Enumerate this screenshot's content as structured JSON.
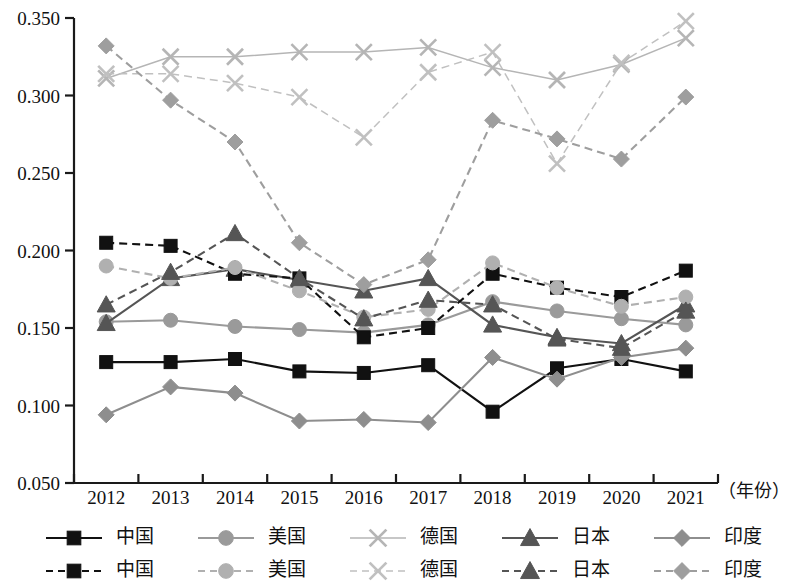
{
  "chart_data": {
    "type": "line",
    "title": "",
    "xlabel": "（年份）",
    "ylabel": "",
    "categories": [
      "2012",
      "2013",
      "2014",
      "2015",
      "2016",
      "2017",
      "2018",
      "2019",
      "2020",
      "2021"
    ],
    "x": [
      2012,
      2013,
      2014,
      2015,
      2016,
      2017,
      2018,
      2019,
      2020,
      2021
    ],
    "ylim": [
      0.05,
      0.35
    ],
    "ytick_labels": [
      "0.350",
      "0.300",
      "0.250",
      "0.200",
      "0.150",
      "0.100",
      "0.050"
    ],
    "yticks": [
      0.35,
      0.3,
      0.25,
      0.2,
      0.15,
      0.1,
      0.05
    ],
    "grid": false,
    "legend_position": "bottom",
    "series": [
      {
        "name": "中国",
        "legend_label": "中国",
        "style": "solid",
        "marker": "square",
        "color": "#111111",
        "values": [
          0.128,
          0.128,
          0.13,
          0.122,
          0.121,
          0.126,
          0.096,
          0.124,
          0.13,
          0.122
        ]
      },
      {
        "name": "美国",
        "legend_label": "美国",
        "style": "solid",
        "marker": "circle",
        "color": "#9a9a9a",
        "values": [
          0.154,
          0.155,
          0.151,
          0.149,
          0.147,
          0.152,
          0.167,
          0.161,
          0.156,
          0.152
        ]
      },
      {
        "name": "德国",
        "legend_label": "德国",
        "style": "solid",
        "marker": "cross",
        "color": "#b5b5b5",
        "values": [
          0.311,
          0.325,
          0.325,
          0.328,
          0.328,
          0.331,
          0.318,
          0.31,
          0.32,
          0.337
        ]
      },
      {
        "name": "日本",
        "legend_label": "日本",
        "style": "solid",
        "marker": "triangle",
        "color": "#555555",
        "values": [
          0.153,
          0.182,
          0.188,
          0.181,
          0.174,
          0.182,
          0.152,
          0.144,
          0.14,
          0.165
        ]
      },
      {
        "name": "印度",
        "legend_label": "印度",
        "style": "solid",
        "marker": "diamond",
        "color": "#8e8e8e",
        "values": [
          0.094,
          0.112,
          0.108,
          0.09,
          0.091,
          0.089,
          0.131,
          0.117,
          0.131,
          0.137
        ]
      },
      {
        "name": "中国",
        "legend_label": "中国",
        "style": "dashed",
        "marker": "square",
        "color": "#111111",
        "values": [
          0.205,
          0.203,
          0.185,
          0.182,
          0.144,
          0.15,
          0.185,
          0.176,
          0.17,
          0.187
        ]
      },
      {
        "name": "美国",
        "legend_label": "美国",
        "style": "dashed",
        "marker": "circle",
        "color": "#b0b0b0",
        "values": [
          0.19,
          0.182,
          0.189,
          0.174,
          0.157,
          0.162,
          0.192,
          0.176,
          0.164,
          0.17
        ]
      },
      {
        "name": "德国",
        "legend_label": "德国",
        "style": "dashed",
        "marker": "cross",
        "color": "#c0c0c0",
        "values": [
          0.314,
          0.314,
          0.308,
          0.299,
          0.273,
          0.315,
          0.328,
          0.256,
          0.321,
          0.348
        ]
      },
      {
        "name": "日本",
        "legend_label": "日本",
        "style": "dashed",
        "marker": "triangle",
        "color": "#555555",
        "values": [
          0.165,
          0.186,
          0.211,
          0.182,
          0.156,
          0.168,
          0.165,
          0.143,
          0.137,
          0.161
        ]
      },
      {
        "name": "印度",
        "legend_label": "印度",
        "style": "dashed",
        "marker": "diamond",
        "color": "#9e9e9e",
        "values": [
          0.332,
          0.297,
          0.27,
          0.205,
          0.178,
          0.194,
          0.284,
          0.272,
          0.259,
          0.299
        ]
      }
    ]
  },
  "legend": {
    "rows": [
      {
        "style": "solid",
        "items": [
          {
            "label": "中国",
            "marker": "square",
            "color": "#111111"
          },
          {
            "label": "美国",
            "marker": "circle",
            "color": "#9a9a9a"
          },
          {
            "label": "德国",
            "marker": "cross",
            "color": "#b5b5b5"
          },
          {
            "label": "日本",
            "marker": "triangle",
            "color": "#555555"
          },
          {
            "label": "印度",
            "marker": "diamond",
            "color": "#8e8e8e"
          }
        ]
      },
      {
        "style": "dashed",
        "items": [
          {
            "label": "中国",
            "marker": "square",
            "color": "#111111"
          },
          {
            "label": "美国",
            "marker": "circle",
            "color": "#b0b0b0"
          },
          {
            "label": "德国",
            "marker": "cross",
            "color": "#c0c0c0"
          },
          {
            "label": "日本",
            "marker": "triangle",
            "color": "#555555"
          },
          {
            "label": "印度",
            "marker": "diamond",
            "color": "#9e9e9e"
          }
        ]
      }
    ]
  }
}
